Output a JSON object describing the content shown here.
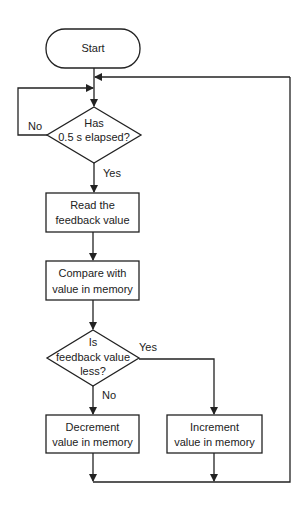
{
  "diagram": {
    "type": "flowchart",
    "nodes": {
      "start": {
        "label": "Start"
      },
      "check_time": {
        "line1": "Has",
        "line2": "0.5 s elapsed?"
      },
      "read": {
        "line1": "Read the",
        "line2": "feedback value"
      },
      "compare": {
        "line1": "Compare with",
        "line2": "value in memory"
      },
      "check_less": {
        "line1": "Is",
        "line2": "feedback value",
        "line3": "less?"
      },
      "decrement": {
        "line1": "Decrement",
        "line2": "value in memory"
      },
      "increment": {
        "line1": "Increment",
        "line2": "value in memory"
      }
    },
    "edges": {
      "time_no": "No",
      "time_yes": "Yes",
      "less_yes": "Yes",
      "less_no": "No"
    },
    "colors": {
      "stroke": "#222222",
      "background": "#ffffff"
    }
  }
}
